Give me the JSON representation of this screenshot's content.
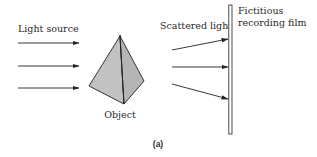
{
  "diagram": {
    "caption": "(a)",
    "labels": {
      "light_source": "Light source",
      "object": "Object",
      "scattered_light": "Scattered light",
      "film_line1": "Fictitious",
      "film_line2": "recording film"
    },
    "colors": {
      "object_fill": "#bdbdbd",
      "stroke": "#222222",
      "film_fill": "#ffffff",
      "background": "#ffffff"
    },
    "incident_rays": [
      {
        "x1": 18,
        "y1": 43,
        "x2": 79,
        "y2": 43
      },
      {
        "x1": 18,
        "y1": 66,
        "x2": 79,
        "y2": 66
      },
      {
        "x1": 18,
        "y1": 88,
        "x2": 79,
        "y2": 88
      }
    ],
    "scattered_rays": [
      {
        "x1": 172,
        "y1": 50,
        "x2": 228,
        "y2": 39
      },
      {
        "x1": 172,
        "y1": 67,
        "x2": 228,
        "y2": 67
      },
      {
        "x1": 172,
        "y1": 84,
        "x2": 228,
        "y2": 99
      }
    ]
  }
}
